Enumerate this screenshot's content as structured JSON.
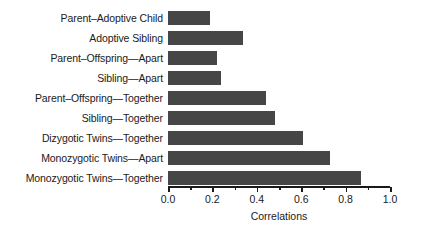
{
  "chart_data": {
    "type": "bar",
    "orientation": "horizontal",
    "title": "",
    "subtitle": "",
    "xlabel": "Correlations",
    "ylabel": "",
    "xlim": [
      0.0,
      1.0
    ],
    "grid": false,
    "legend": null,
    "bar_color": "#464646",
    "axis_color": "#1a1a1a",
    "background": "#ffffff",
    "xticks": [
      "0.0",
      "0.2",
      "0.4",
      "0.6",
      "0.8",
      "1.0"
    ],
    "xtick_values": [
      0.0,
      0.2,
      0.4,
      0.6,
      0.8,
      1.0
    ],
    "minor_tick_values": [
      0.1,
      0.3,
      0.5,
      0.7,
      0.9
    ],
    "categories": [
      "Parent–Adoptive Child",
      "Adoptive Sibling",
      "Parent–Offspring—Apart",
      "Sibling—Apart",
      "Parent–Offspring—Together",
      "Sibling—Together",
      "Dizygotic Twins—Together",
      "Monozygotic Twins—Apart",
      "Monozygotic Twins—Together"
    ],
    "values": [
      0.19,
      0.34,
      0.22,
      0.24,
      0.44,
      0.48,
      0.61,
      0.73,
      0.87
    ]
  }
}
